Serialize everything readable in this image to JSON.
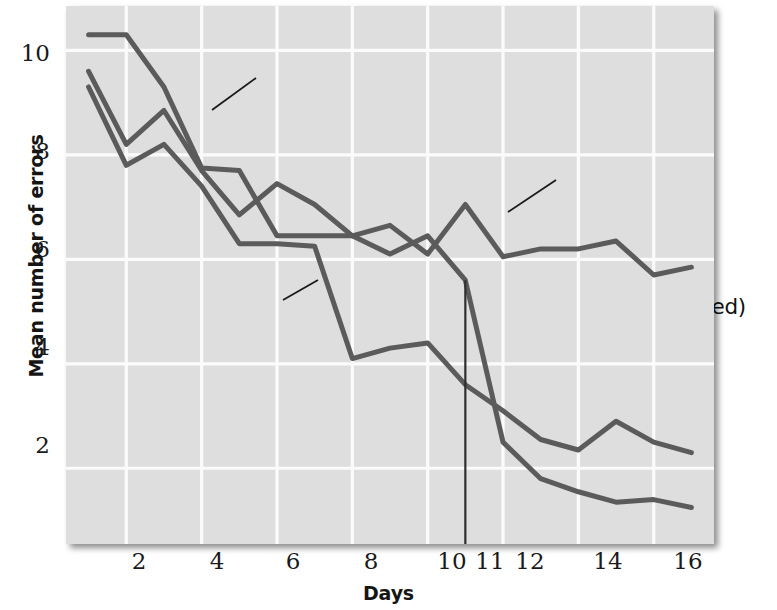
{
  "chart_data": {
    "type": "line",
    "title": "",
    "xlabel": "Days",
    "ylabel": "Mean number of errors",
    "xlim": [
      0.4,
      17.6
    ],
    "ylim": [
      0.55,
      10.85
    ],
    "xticks": [
      2,
      4,
      6,
      8,
      10,
      11,
      12,
      14,
      16
    ],
    "yticks": [
      2,
      4,
      6,
      8,
      10
    ],
    "grid": true,
    "legend_position": "inline-annotations",
    "x": [
      1,
      2,
      3,
      4,
      5,
      6,
      7,
      8,
      9,
      10,
      11,
      12,
      13,
      14,
      15,
      16,
      17
    ],
    "series": [
      {
        "name": "Group A",
        "description": "reinforced on each trial",
        "color": "#5b5b5b",
        "values": [
          9.3,
          7.8,
          8.2,
          7.4,
          6.3,
          6.3,
          6.25,
          4.1,
          4.3,
          4.4,
          3.6,
          3.1,
          2.55,
          2.35,
          2.9,
          2.5,
          2.3
        ]
      },
      {
        "name": "Group B",
        "description": "never reinforced",
        "color": "#5b5b5b",
        "values": [
          9.6,
          8.2,
          8.85,
          7.7,
          6.85,
          7.45,
          7.05,
          6.45,
          6.65,
          6.1,
          7.05,
          6.05,
          6.2,
          6.2,
          6.35,
          5.7,
          5.85
        ]
      },
      {
        "name": "Group C",
        "description": "reinforced on day 11",
        "color": "#5b5b5b",
        "values": [
          10.3,
          10.3,
          9.3,
          7.75,
          7.7,
          6.45,
          6.45,
          6.45,
          6.1,
          6.45,
          5.6,
          2.5,
          1.8,
          1.55,
          1.35,
          1.4,
          1.25
        ]
      }
    ],
    "marker_line": {
      "name": "day-11-marker",
      "x": 11,
      "y_from": 5.6,
      "y_to": 0.55
    },
    "annotations": [
      {
        "id": "group-c",
        "lines": [
          "Group C",
          "(reinforced",
          "on day 11)"
        ],
        "leader_from": [
          256,
          78
        ],
        "leader_to": [
          212,
          110
        ]
      },
      {
        "id": "group-b",
        "lines": [
          "Group B",
          "(never reinforced)"
        ],
        "leader_from": [
          556,
          180
        ],
        "leader_to": [
          508,
          212
        ]
      },
      {
        "id": "group-a",
        "lines": [
          "Group A",
          "(reinforced",
          "on each trial)"
        ],
        "leader_from": [
          283,
          300
        ],
        "leader_to": [
          318,
          280
        ]
      }
    ]
  },
  "colors": {
    "plot_background": "#dedede",
    "grid": "#fbfbfb",
    "line": "#5b5b5b",
    "marker_line": "#2e2e2e",
    "text": "#1a1a1a",
    "page_background": "#ffffff"
  }
}
